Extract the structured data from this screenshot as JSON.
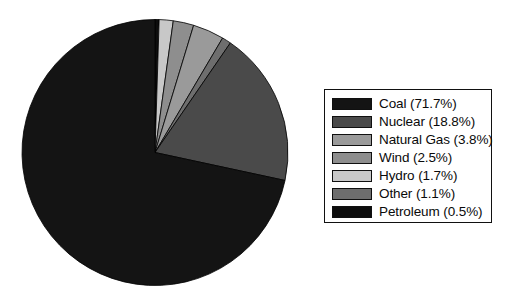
{
  "chart_data": {
    "type": "pie",
    "title": "",
    "categories": [
      "Coal",
      "Nuclear",
      "Natural Gas",
      "Wind",
      "Hydro",
      "Other",
      "Petroleum"
    ],
    "values": [
      71.7,
      18.8,
      3.8,
      2.5,
      1.7,
      1.1,
      0.5
    ],
    "units": "percent",
    "start_angle_deg": 0,
    "direction": "clockwise",
    "draw_order": [
      "Petroleum",
      "Hydro",
      "Wind",
      "Natural Gas",
      "Other",
      "Nuclear",
      "Coal"
    ],
    "legend_position": "right",
    "grid": false,
    "colors": {
      "Coal": "#141414",
      "Nuclear": "#4a4a4a",
      "Natural Gas": "#9a9a9a",
      "Wind": "#8e8e8e",
      "Hydro": "#c8c8c8",
      "Other": "#6e6e6e",
      "Petroleum": "#0d0d0d"
    },
    "slices": [
      {
        "label": "Coal",
        "value": 71.7,
        "legend_text": "Coal (71.7%)",
        "color": "#141414"
      },
      {
        "label": "Nuclear",
        "value": 18.8,
        "legend_text": "Nuclear (18.8%)",
        "color": "#4a4a4a"
      },
      {
        "label": "Natural Gas",
        "value": 3.8,
        "legend_text": "Natural Gas (3.8%)",
        "color": "#9a9a9a"
      },
      {
        "label": "Wind",
        "value": 2.5,
        "legend_text": "Wind (2.5%)",
        "color": "#8e8e8e"
      },
      {
        "label": "Hydro",
        "value": 1.7,
        "legend_text": "Hydro (1.7%)",
        "color": "#c8c8c8"
      },
      {
        "label": "Other",
        "value": 1.1,
        "legend_text": "Other (1.1%)",
        "color": "#6e6e6e"
      },
      {
        "label": "Petroleum",
        "value": 0.5,
        "legend_text": "Petroleum (0.5%)",
        "color": "#0d0d0d"
      }
    ]
  },
  "legend": {
    "items": [
      {
        "text": "Coal (71.7%)",
        "color": "#141414"
      },
      {
        "text": "Nuclear (18.8%)",
        "color": "#4a4a4a"
      },
      {
        "text": "Natural Gas (3.8%)",
        "color": "#9a9a9a"
      },
      {
        "text": "Wind (2.5%)",
        "color": "#8e8e8e"
      },
      {
        "text": "Hydro (1.7%)",
        "color": "#c8c8c8"
      },
      {
        "text": "Other (1.1%)",
        "color": "#6e6e6e"
      },
      {
        "text": "Petroleum (0.5%)",
        "color": "#0d0d0d"
      }
    ]
  }
}
